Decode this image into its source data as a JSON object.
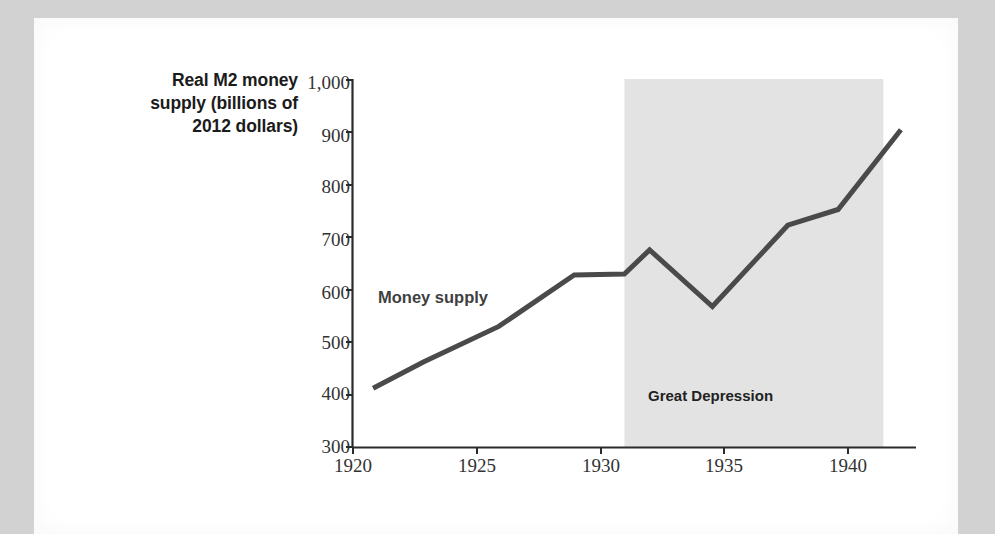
{
  "figure": {
    "background_color": "#ffffff",
    "page_border_color": "#d2d2d2"
  },
  "chart_data": {
    "type": "line",
    "title": "",
    "xlabel": "",
    "ylabel": "Real M2 money supply (billions of 2012 dollars)",
    "ylabel_lines": [
      "Real M2 money",
      "supply (billions of",
      "2012 dollars)"
    ],
    "xlim": [
      1919.2,
      1941.6
    ],
    "ylim": [
      300,
      1000
    ],
    "grid": false,
    "legend": "none",
    "xticks": [
      1920,
      1925,
      1930,
      1935,
      1940
    ],
    "xtick_labels": [
      "1920",
      "1925",
      "1930",
      "1935",
      "1940"
    ],
    "yticks": [
      300,
      400,
      500,
      600,
      700,
      800,
      900,
      1000
    ],
    "ytick_labels": [
      "300",
      "400",
      "500",
      "600",
      "700",
      "800",
      "900",
      "1,000"
    ],
    "series": [
      {
        "name": "Money supply",
        "color": "#4a4a4a",
        "line_width": 5,
        "x": [
          1920,
          1922,
          1925,
          1928,
          1930,
          1931,
          1933.5,
          1936.5,
          1938.5,
          1941
        ],
        "y": [
          412,
          462,
          530,
          628,
          630,
          676,
          568,
          723,
          753,
          905
        ]
      }
    ],
    "annotations": [
      {
        "name": "series-label",
        "text": "Money supply",
        "x": 1921.6,
        "y": 598,
        "color": "#3f3f3f",
        "bold": true
      },
      {
        "name": "recession-label",
        "text": "Great Depression",
        "x": 1934.6,
        "y": 412,
        "color": "#222222",
        "bold": true
      }
    ],
    "shaded_regions": [
      {
        "name": "great-depression-band",
        "label": "Great Depression",
        "x_start": 1930,
        "x_end": 1940.3,
        "y_start": 300,
        "y_end": 1000,
        "color": "#e3e3e3"
      }
    ],
    "axis_color": "#2b2b2b"
  }
}
